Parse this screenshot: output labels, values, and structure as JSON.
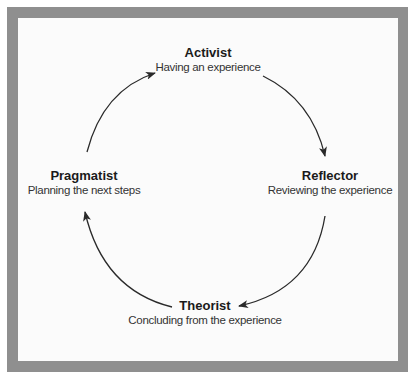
{
  "diagram": {
    "type": "cycle",
    "direction": "clockwise",
    "colors": {
      "frame": "#8f8f8f",
      "background": "#fbfbfb",
      "text": "#222222",
      "arrow": "#2a2a2a"
    },
    "nodes": [
      {
        "id": "activist",
        "title": "Activist",
        "subtitle": "Having an experience"
      },
      {
        "id": "reflector",
        "title": "Reflector",
        "subtitle": "Reviewing the experience"
      },
      {
        "id": "theorist",
        "title": "Theorist",
        "subtitle": "Concluding from the experience"
      },
      {
        "id": "pragmatist",
        "title": "Pragmatist",
        "subtitle": "Planning the next steps"
      }
    ],
    "edges": [
      {
        "from": "activist",
        "to": "reflector"
      },
      {
        "from": "reflector",
        "to": "theorist"
      },
      {
        "from": "theorist",
        "to": "pragmatist"
      },
      {
        "from": "pragmatist",
        "to": "activist"
      }
    ]
  }
}
